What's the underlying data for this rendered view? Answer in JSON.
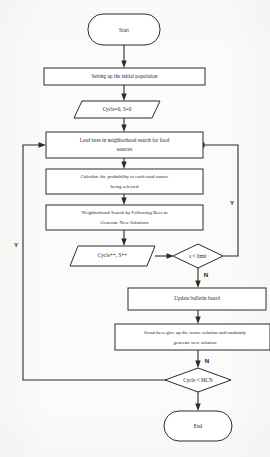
{
  "diagram": {
    "colors": {
      "stroke": "#2b2b2b",
      "fill": "#ffffff",
      "background": "#fbfbfa",
      "text": "#1d1d1d"
    },
    "nodes": {
      "start": {
        "label": "Start",
        "type": "terminator"
      },
      "init_population": {
        "label": "Setting up the initial population",
        "type": "process"
      },
      "cycle_init": {
        "label": "Cycle=0, S=0",
        "type": "data"
      },
      "lead_bees": {
        "label_line1": "Lead bees in neighborhood search for food",
        "label_line2": "sources",
        "type": "process"
      },
      "calc_probability": {
        "label_line1": "Calculate the probability of each food source",
        "label_line2": "being selected",
        "type": "process"
      },
      "following_bees": {
        "label_line1": "Neighborhood Search by Following Bees to",
        "label_line2": "Generate New Solutions",
        "type": "process"
      },
      "cycle_increment": {
        "label": "Cycle++, S++",
        "type": "data"
      },
      "s_limit": {
        "label": "s < limit",
        "type": "decision"
      },
      "update_board": {
        "label": "Update bulletin board",
        "type": "process"
      },
      "scout_bees": {
        "label_line1": "Scout bees give up the worse solution and randomly",
        "label_line2": "generate new solution",
        "type": "process"
      },
      "cycle_mcn": {
        "label": "Cycle < MCN",
        "type": "decision"
      },
      "end": {
        "label": "End",
        "type": "terminator"
      }
    },
    "branch_labels": {
      "s_limit_yes": "Y",
      "s_limit_no": "N",
      "cycle_mcn_yes": "Y",
      "cycle_mcn_no": "N"
    }
  }
}
